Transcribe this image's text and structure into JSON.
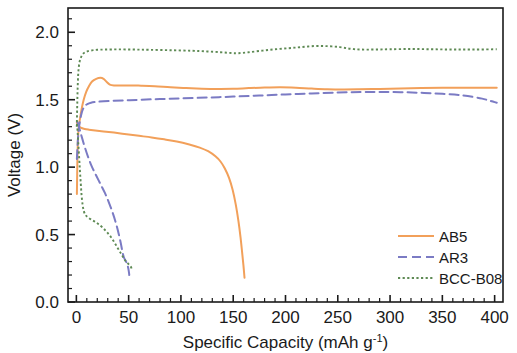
{
  "chart_data": {
    "type": "line",
    "title": "",
    "xlabel": "Specific Capacity (mAh g-1)",
    "xlabel_main": "Specific Capacity (mAh g",
    "xlabel_sup": "-1",
    "xlabel_tail": ")",
    "ylabel": "Voltage (V)",
    "xlim": [
      -8,
      408
    ],
    "ylim": [
      0.0,
      2.18
    ],
    "xticks": [
      0,
      50,
      100,
      150,
      200,
      250,
      300,
      350,
      400
    ],
    "xtick_labels": [
      "0",
      "50",
      "100",
      "150",
      "200",
      "250",
      "300",
      "350",
      "400"
    ],
    "yticks": [
      0.0,
      0.5,
      1.0,
      1.5,
      2.0
    ],
    "ytick_labels": [
      "0.0",
      "0.5",
      "1.0",
      "1.5",
      "2.0"
    ],
    "x_minor_step": 10,
    "y_minor_step": 0.1,
    "grid": false,
    "legend_position": "bottom-right",
    "colors": {
      "AB5": "#F2A05A",
      "AR3": "#7B7BC4",
      "BCC-B08": "#5E8A54",
      "axis": "#1a1a1a",
      "background": "#ffffff"
    },
    "series": [
      {
        "name": "AB5",
        "label": "AB5",
        "color": "#F2A05A",
        "style": "solid",
        "branch": "charge",
        "points": [
          [
            0.5,
            0.8
          ],
          [
            1.0,
            1.05
          ],
          [
            1.6,
            1.22
          ],
          [
            2.4,
            1.31
          ],
          [
            3.5,
            1.36
          ],
          [
            5.0,
            1.43
          ],
          [
            7.0,
            1.5
          ],
          [
            9.5,
            1.56
          ],
          [
            12.0,
            1.6
          ],
          [
            15.0,
            1.635
          ],
          [
            19.0,
            1.655
          ],
          [
            23.0,
            1.662
          ],
          [
            26.0,
            1.655
          ],
          [
            29.0,
            1.632
          ],
          [
            32.0,
            1.612
          ],
          [
            36.0,
            1.606
          ],
          [
            42.0,
            1.606
          ],
          [
            50.0,
            1.606
          ],
          [
            62.0,
            1.604
          ],
          [
            75.0,
            1.6
          ],
          [
            90.0,
            1.592
          ],
          [
            105.0,
            1.586
          ],
          [
            120.0,
            1.582
          ],
          [
            135.0,
            1.58
          ],
          [
            150.0,
            1.581
          ],
          [
            165.0,
            1.586
          ],
          [
            180.0,
            1.59
          ],
          [
            195.0,
            1.592
          ],
          [
            210.0,
            1.589
          ],
          [
            225.0,
            1.583
          ],
          [
            240.0,
            1.578
          ],
          [
            255.0,
            1.576
          ],
          [
            270.0,
            1.577
          ],
          [
            290.0,
            1.58
          ],
          [
            310.0,
            1.583
          ],
          [
            330.0,
            1.586
          ],
          [
            350.0,
            1.588
          ],
          [
            370.0,
            1.589
          ],
          [
            390.0,
            1.589
          ],
          [
            402.0,
            1.589
          ]
        ]
      },
      {
        "name": "AB5",
        "label": "AB5",
        "color": "#F2A05A",
        "style": "solid",
        "branch": "discharge",
        "points": [
          [
            0.5,
            1.33
          ],
          [
            1.5,
            1.315
          ],
          [
            3.0,
            1.3
          ],
          [
            5.0,
            1.29
          ],
          [
            8.0,
            1.283
          ],
          [
            12.0,
            1.278
          ],
          [
            18.0,
            1.272
          ],
          [
            26.0,
            1.265
          ],
          [
            36.0,
            1.256
          ],
          [
            48.0,
            1.244
          ],
          [
            60.0,
            1.232
          ],
          [
            72.0,
            1.22
          ],
          [
            84.0,
            1.206
          ],
          [
            96.0,
            1.19
          ],
          [
            108.0,
            1.168
          ],
          [
            118.0,
            1.145
          ],
          [
            126.0,
            1.118
          ],
          [
            133.0,
            1.08
          ],
          [
            138.0,
            1.04
          ],
          [
            142.0,
            0.99
          ],
          [
            146.0,
            0.92
          ],
          [
            149.5,
            0.83
          ],
          [
            152.5,
            0.72
          ],
          [
            155.0,
            0.6
          ],
          [
            157.0,
            0.48
          ],
          [
            158.5,
            0.37
          ],
          [
            159.8,
            0.27
          ],
          [
            160.8,
            0.18
          ]
        ]
      },
      {
        "name": "AR3",
        "label": "AR3",
        "color": "#7B7BC4",
        "style": "dashed",
        "branch": "charge",
        "points": [
          [
            0.5,
            1.06
          ],
          [
            1.0,
            1.14
          ],
          [
            1.6,
            1.22
          ],
          [
            2.3,
            1.28
          ],
          [
            3.2,
            1.33
          ],
          [
            4.5,
            1.385
          ],
          [
            6.0,
            1.425
          ],
          [
            8.0,
            1.452
          ],
          [
            10.5,
            1.468
          ],
          [
            14.0,
            1.478
          ],
          [
            19.0,
            1.484
          ],
          [
            26.0,
            1.488
          ],
          [
            35.0,
            1.492
          ],
          [
            48.0,
            1.496
          ],
          [
            62.0,
            1.5
          ],
          [
            80.0,
            1.505
          ],
          [
            100.0,
            1.51
          ],
          [
            125.0,
            1.516
          ],
          [
            150.0,
            1.523
          ],
          [
            175.0,
            1.531
          ],
          [
            200.0,
            1.539
          ],
          [
            225.0,
            1.546
          ],
          [
            250.0,
            1.553
          ],
          [
            272.0,
            1.557
          ],
          [
            290.0,
            1.558
          ],
          [
            310.0,
            1.556
          ],
          [
            330.0,
            1.551
          ],
          [
            350.0,
            1.544
          ],
          [
            370.0,
            1.532
          ],
          [
            388.0,
            1.508
          ],
          [
            400.0,
            1.482
          ],
          [
            402.0,
            1.478
          ]
        ]
      },
      {
        "name": "AR3",
        "label": "AR3",
        "color": "#7B7BC4",
        "style": "dashed",
        "branch": "discharge",
        "points": [
          [
            1.0,
            1.335
          ],
          [
            2.0,
            1.31
          ],
          [
            3.5,
            1.27
          ],
          [
            5.5,
            1.215
          ],
          [
            8.0,
            1.15
          ],
          [
            11.0,
            1.08
          ],
          [
            14.5,
            1.01
          ],
          [
            18.5,
            0.945
          ],
          [
            23.0,
            0.875
          ],
          [
            27.5,
            0.805
          ],
          [
            31.5,
            0.73
          ],
          [
            35.0,
            0.655
          ],
          [
            38.0,
            0.58
          ],
          [
            40.5,
            0.505
          ],
          [
            42.5,
            0.435
          ],
          [
            44.0,
            0.375
          ],
          [
            45.5,
            0.33
          ],
          [
            47.5,
            0.3
          ],
          [
            49.0,
            0.27
          ],
          [
            50.0,
            0.235
          ],
          [
            50.6,
            0.2
          ]
        ]
      },
      {
        "name": "BCC-B08",
        "label": "BCC-B08",
        "color": "#5E8A54",
        "style": "dotted",
        "branch": "charge",
        "points": [
          [
            0.4,
            1.3
          ],
          [
            0.8,
            1.45
          ],
          [
            1.2,
            1.58
          ],
          [
            1.7,
            1.68
          ],
          [
            2.3,
            1.74
          ],
          [
            3.2,
            1.785
          ],
          [
            4.5,
            1.815
          ],
          [
            6.0,
            1.836
          ],
          [
            8.0,
            1.85
          ],
          [
            11.0,
            1.86
          ],
          [
            15.0,
            1.866
          ],
          [
            20.0,
            1.87
          ],
          [
            28.0,
            1.872
          ],
          [
            40.0,
            1.873
          ],
          [
            55.0,
            1.872
          ],
          [
            70.0,
            1.87
          ],
          [
            90.0,
            1.867
          ],
          [
            110.0,
            1.863
          ],
          [
            125.0,
            1.858
          ],
          [
            138.0,
            1.852
          ],
          [
            148.0,
            1.846
          ],
          [
            155.0,
            1.845
          ],
          [
            165.0,
            1.852
          ],
          [
            178.0,
            1.864
          ],
          [
            190.0,
            1.874
          ],
          [
            203.0,
            1.882
          ],
          [
            215.0,
            1.89
          ],
          [
            228.0,
            1.898
          ],
          [
            240.0,
            1.897
          ],
          [
            252.0,
            1.89
          ],
          [
            262.0,
            1.878
          ],
          [
            272.0,
            1.872
          ],
          [
            285.0,
            1.872
          ],
          [
            300.0,
            1.874
          ],
          [
            320.0,
            1.876
          ],
          [
            340.0,
            1.874
          ],
          [
            360.0,
            1.872
          ],
          [
            380.0,
            1.872
          ],
          [
            402.0,
            1.874
          ]
        ]
      },
      {
        "name": "BCC-B08",
        "label": "BCC-B08",
        "color": "#5E8A54",
        "style": "dotted",
        "branch": "discharge",
        "points": [
          [
            0.6,
            1.32
          ],
          [
            1.2,
            1.26
          ],
          [
            1.8,
            1.18
          ],
          [
            2.6,
            1.08
          ],
          [
            3.4,
            0.975
          ],
          [
            4.2,
            0.88
          ],
          [
            5.0,
            0.79
          ],
          [
            6.0,
            0.72
          ],
          [
            7.2,
            0.672
          ],
          [
            8.8,
            0.645
          ],
          [
            11.0,
            0.628
          ],
          [
            14.0,
            0.612
          ],
          [
            17.5,
            0.596
          ],
          [
            21.0,
            0.578
          ],
          [
            25.0,
            0.552
          ],
          [
            29.0,
            0.52
          ],
          [
            33.0,
            0.482
          ],
          [
            36.5,
            0.44
          ],
          [
            39.5,
            0.4
          ],
          [
            42.0,
            0.368
          ],
          [
            44.0,
            0.342
          ],
          [
            45.5,
            0.322
          ],
          [
            47.0,
            0.305
          ],
          [
            48.5,
            0.292
          ],
          [
            50.0,
            0.28
          ],
          [
            51.5,
            0.268
          ],
          [
            52.5,
            0.255
          ],
          [
            53.0,
            0.24
          ]
        ]
      }
    ],
    "legend": [
      {
        "label": "AB5",
        "color": "#F2A05A",
        "style": "solid"
      },
      {
        "label": "AR3",
        "color": "#7B7BC4",
        "style": "dashed"
      },
      {
        "label": "BCC-B08",
        "color": "#5E8A54",
        "style": "dotted"
      }
    ]
  }
}
